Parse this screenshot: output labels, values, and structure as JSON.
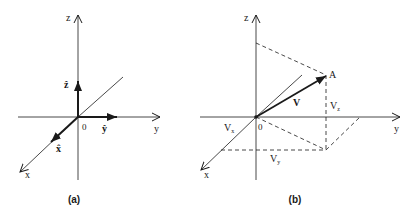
{
  "colors": {
    "ink": "#1a1a1a",
    "background": "#ffffff"
  },
  "panel_a": {
    "caption": "(a)",
    "axes": {
      "x": "x",
      "y": "y",
      "z": "z",
      "origin": "0"
    },
    "unit_vectors": {
      "x_hat": "x̂",
      "y_hat": "ŷ",
      "z_hat": "ẑ"
    }
  },
  "panel_b": {
    "caption": "(b)",
    "axes": {
      "x": "x",
      "y": "y",
      "z": "z",
      "origin": "0"
    },
    "point_label": "A",
    "vector_label": "V",
    "components": {
      "vx": "V",
      "vx_sub": "x",
      "vy": "V",
      "vy_sub": "y",
      "vz": "V",
      "vz_sub": "z"
    }
  }
}
